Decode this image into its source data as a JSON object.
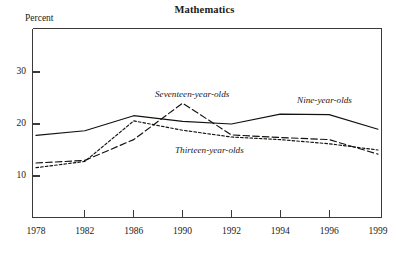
{
  "chart_data": {
    "type": "line",
    "title": "Mathematics",
    "ylabel": "Percent",
    "xlabel": "",
    "categories": [
      "1978",
      "1982",
      "1986",
      "1990",
      "1992",
      "1994",
      "1996",
      "1999"
    ],
    "ylim": [
      0,
      36
    ],
    "ytick_labels": [
      "10",
      "20",
      "30"
    ],
    "ytick_values": [
      10,
      20,
      30
    ],
    "grid": false,
    "legend_position": "inline-annotations",
    "series": [
      {
        "name": "Nine-year-olds",
        "line_style": "solid",
        "values": [
          17.8,
          18.7,
          21.6,
          20.5,
          20.0,
          21.9,
          21.8,
          19.0
        ]
      },
      {
        "name": "Thirteen-year-olds",
        "line_style": "short-dash",
        "values": [
          11.6,
          12.8,
          20.6,
          18.8,
          17.5,
          17.0,
          16.2,
          15.0
        ]
      },
      {
        "name": "Seventeen-year-olds",
        "line_style": "long-dash",
        "values": [
          12.5,
          13.0,
          17.0,
          24.0,
          17.9,
          17.4,
          17.0,
          14.2
        ]
      }
    ],
    "annotations": [
      {
        "text": "Seventeen-year-olds",
        "x": 155,
        "y": 89
      },
      {
        "text": "Nine-year-olds",
        "x": 297,
        "y": 95
      },
      {
        "text": "Thirteen-year-olds",
        "x": 175,
        "y": 145
      }
    ],
    "colors": {
      "line": "#14120f",
      "axis": "#3a3a3a",
      "background": "#ffffff"
    }
  }
}
